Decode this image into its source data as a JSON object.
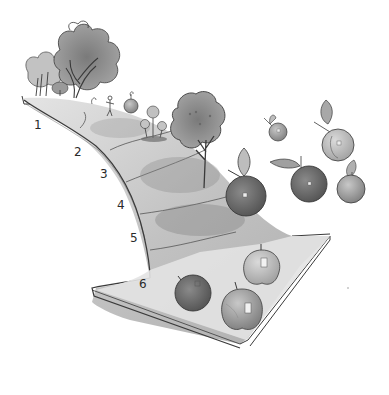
{
  "diagram": {
    "type": "process-arrow",
    "style": "grayscale watercolor illustration",
    "stages": [
      {
        "number": "1",
        "depiction": "orchard with full-grown trees and a small figure"
      },
      {
        "number": "2",
        "depiction": "young saplings"
      },
      {
        "number": "3",
        "depiction": "mature apple tree"
      },
      {
        "number": "4",
        "depiction": "apple on branch with leaf"
      },
      {
        "number": "5",
        "depiction": "apples with stickers"
      },
      {
        "number": "6",
        "depiction": "harvested labeled apples on arrowhead"
      }
    ]
  },
  "colors": {
    "background": "#ffffff",
    "outline": "#3a3a3a",
    "road_light": "#dcdcdc",
    "road_mid": "#c4c4c4",
    "road_dark": "#a8a8a8",
    "arrowhead": "#e2e2e2",
    "foliage": "#8c8c8c",
    "foliage_dark": "#6e6e6e",
    "apple_dark": "#6a6a6a",
    "apple_mid": "#9a9a9a",
    "apple_light": "#bdbdbd"
  }
}
